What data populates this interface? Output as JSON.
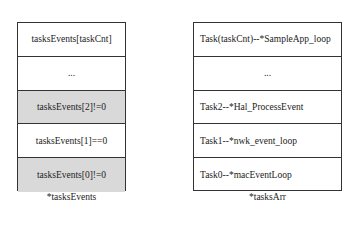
{
  "left_stack": {
    "caption": "*tasksEvents",
    "cells": [
      {
        "label": "tasksEvents[taskCnt]",
        "shaded": false
      },
      {
        "label": "...",
        "shaded": false
      },
      {
        "label": "tasksEvents[2]!=0",
        "shaded": true
      },
      {
        "label": "tasksEvents[1]==0",
        "shaded": false
      },
      {
        "label": "tasksEvents[0]!=0",
        "shaded": true
      }
    ]
  },
  "right_stack": {
    "caption": "*tasksArr",
    "cells": [
      {
        "label": "Task(taskCnt)--*SampleApp_loop"
      },
      {
        "label": "..."
      },
      {
        "label": "Task2--*Hal_ProcessEvent"
      },
      {
        "label": "Task1--*nwk_event_loop"
      },
      {
        "label": "Task0--*macEventLoop"
      }
    ]
  },
  "colors": {
    "shaded": "#d9d9d9",
    "border": "#333333"
  }
}
